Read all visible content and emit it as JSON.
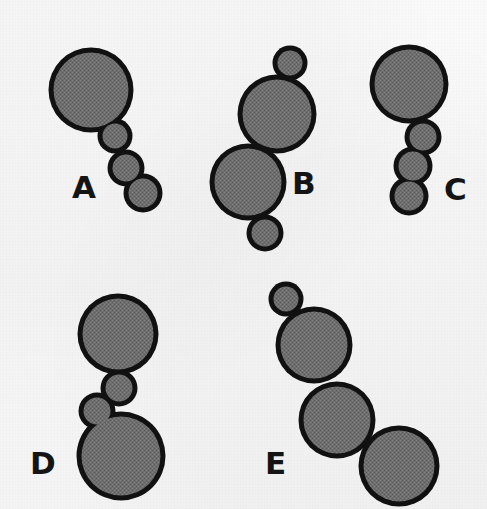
{
  "figure": {
    "width": 487,
    "height": 509,
    "background_color": "#f7f7f7",
    "fill_color": "#6e6e6e",
    "outline_color": "#111111",
    "outline_width": 5,
    "label_color": "#141414"
  },
  "groups": [
    {
      "id": "A",
      "label": "A",
      "label_x": 72,
      "label_y": 172,
      "circle_count": 4,
      "circles": [
        {
          "cx": 91,
          "cy": 90,
          "r": 40
        },
        {
          "cx": 115,
          "cy": 136,
          "r": 15
        },
        {
          "cx": 126,
          "cy": 168,
          "r": 16
        },
        {
          "cx": 143,
          "cy": 193,
          "r": 17
        }
      ]
    },
    {
      "id": "B",
      "label": "B",
      "label_x": 292,
      "label_y": 168,
      "circle_count": 4,
      "circles": [
        {
          "cx": 290,
          "cy": 63,
          "r": 15
        },
        {
          "cx": 277,
          "cy": 114,
          "r": 37
        },
        {
          "cx": 248,
          "cy": 182,
          "r": 36
        },
        {
          "cx": 265,
          "cy": 233,
          "r": 16
        }
      ]
    },
    {
      "id": "C",
      "label": "C",
      "label_x": 444,
      "label_y": 174,
      "circle_count": 4,
      "circles": [
        {
          "cx": 409,
          "cy": 84,
          "r": 37
        },
        {
          "cx": 423,
          "cy": 137,
          "r": 16
        },
        {
          "cx": 413,
          "cy": 166,
          "r": 17
        },
        {
          "cx": 409,
          "cy": 196,
          "r": 17
        }
      ]
    },
    {
      "id": "D",
      "label": "D",
      "label_x": 30,
      "label_y": 448,
      "circle_count": 4,
      "circles": [
        {
          "cx": 118,
          "cy": 334,
          "r": 38
        },
        {
          "cx": 119,
          "cy": 388,
          "r": 16
        },
        {
          "cx": 97,
          "cy": 411,
          "r": 16
        },
        {
          "cx": 121,
          "cy": 456,
          "r": 42
        }
      ]
    },
    {
      "id": "E",
      "label": "E",
      "label_x": 265,
      "label_y": 448,
      "circle_count": 4,
      "circles": [
        {
          "cx": 286,
          "cy": 299,
          "r": 15
        },
        {
          "cx": 314,
          "cy": 345,
          "r": 36
        },
        {
          "cx": 337,
          "cy": 420,
          "r": 36
        },
        {
          "cx": 399,
          "cy": 466,
          "r": 38
        }
      ]
    }
  ]
}
